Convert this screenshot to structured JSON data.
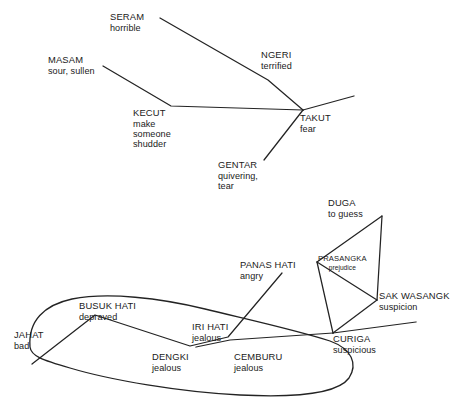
{
  "diagram": {
    "kind": "semantic-network",
    "line_color": "#232323",
    "background_color": "#ffffff",
    "clusters": [
      {
        "id": "fear",
        "nodes": [
          {
            "id": "seram",
            "term": "SERAM",
            "gloss": "horrible"
          },
          {
            "id": "masam",
            "term": "MASAM",
            "gloss": "sour, sullen"
          },
          {
            "id": "kecut",
            "term": "KECUT",
            "gloss": "make someone shudder"
          },
          {
            "id": "ngeri",
            "term": "NGERI",
            "gloss": "terrified"
          },
          {
            "id": "takut",
            "term": "TAKUT",
            "gloss": "fear"
          },
          {
            "id": "gentar",
            "term": "GENTAR",
            "gloss": "quivering, tear"
          }
        ]
      },
      {
        "id": "suspicion",
        "nodes": [
          {
            "id": "duga",
            "term": "DUGA",
            "gloss": "to guess"
          },
          {
            "id": "prasangka",
            "term": "PRASANGKA",
            "gloss": "prejudice"
          },
          {
            "id": "sak_wasangk",
            "term": "SAK WASANGK",
            "gloss": "suspicion"
          },
          {
            "id": "curiga",
            "term": "CURIGA",
            "gloss": "suspicious"
          },
          {
            "id": "panas_hati",
            "term": "PANAS HATI",
            "gloss": "angry"
          }
        ]
      },
      {
        "id": "jealousy",
        "nodes": [
          {
            "id": "jahat",
            "term": "JAHAT",
            "gloss": "bad"
          },
          {
            "id": "busuk_hati",
            "term": "BUSUK HATI",
            "gloss": "depraved"
          },
          {
            "id": "dengki",
            "term": "DENGKI",
            "gloss": "jealous"
          },
          {
            "id": "iri_hati",
            "term": "IRI HATI",
            "gloss": "jealous"
          },
          {
            "id": "cemburu",
            "term": "CEMBURU",
            "gloss": "jealous"
          }
        ]
      }
    ],
    "labels": {
      "seram_term": "SERAM",
      "seram_gloss": "horrible",
      "masam_term": "MASAM",
      "masam_gloss": "sour, sullen",
      "kecut_term": "KECUT",
      "kecut_gloss_1": "make",
      "kecut_gloss_2": "someone",
      "kecut_gloss_3": "shudder",
      "ngeri_term": "NGERI",
      "ngeri_gloss": "terrified",
      "takut_term": "TAKUT",
      "takut_gloss": "fear",
      "gentar_term": "GENTAR",
      "gentar_gloss_1": "quivering,",
      "gentar_gloss_2": "tear",
      "duga_term": "DUGA",
      "duga_gloss": "to guess",
      "prasangka_term": "PRASANGKA",
      "prasangka_gloss": "prejudice",
      "sak_wasangk_term": "SAK WASANGK",
      "sak_wasangk_gloss": "suspicion",
      "curiga_term": "CURIGA",
      "curiga_gloss": "suspicious",
      "panas_hati_term": "PANAS HATI",
      "panas_hati_gloss": "angry",
      "jahat_term": "JAHAT",
      "jahat_gloss": "bad",
      "busuk_hati_term": "BUSUK HATI",
      "busuk_hati_gloss": "depraved",
      "dengki_term": "DENGKI",
      "dengki_gloss": "jealous",
      "iri_hati_term": "IRI HATI",
      "iri_hati_gloss": "jealous",
      "cemburu_term": "CEMBURU",
      "cemburu_gloss": "jealous"
    }
  }
}
